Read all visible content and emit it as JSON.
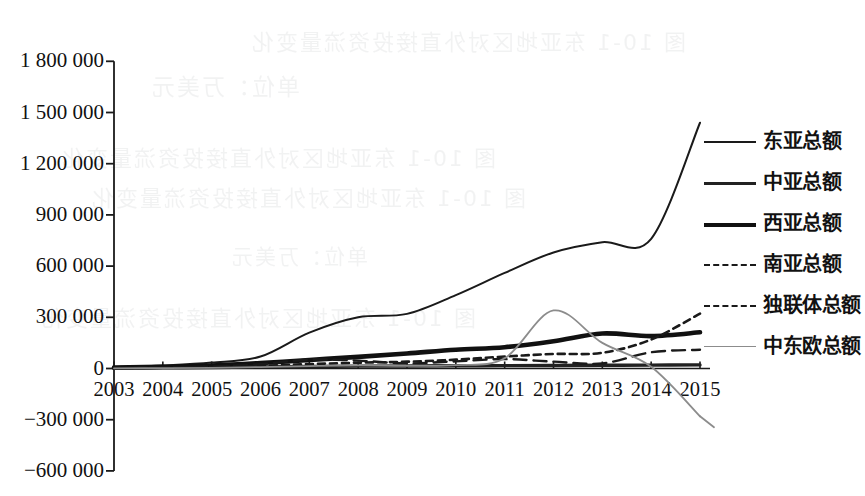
{
  "chart_data": {
    "type": "line",
    "title": "",
    "xlabel": "",
    "ylabel": "",
    "grid": false,
    "legend_position": "right",
    "x": [
      2003,
      2004,
      2005,
      2006,
      2007,
      2008,
      2009,
      2010,
      2011,
      2012,
      2013,
      2014,
      2015
    ],
    "xtick_labels": [
      "2003",
      "2004",
      "2005",
      "2006",
      "2007",
      "2008",
      "2009",
      "2010",
      "2011",
      "2012",
      "2013",
      "2014",
      "2015"
    ],
    "ytick_labels": [
      "1 800 000",
      "1 500 000",
      "1 200 000",
      "900 000",
      "600 000",
      "300 000",
      "0",
      "−300 000",
      "−600 000"
    ],
    "ytick_values": [
      1800000,
      1500000,
      1200000,
      900000,
      600000,
      300000,
      0,
      -300000,
      -600000
    ],
    "ylim": [
      -600000,
      1800000
    ],
    "xlim": [
      2003,
      2015
    ],
    "series": [
      {
        "name": "东亚总额",
        "style": "solid",
        "width": 2.0,
        "color": "#1a1a1a",
        "values": [
          8000,
          18000,
          35000,
          70000,
          210000,
          300000,
          320000,
          430000,
          560000,
          680000,
          740000,
          760000,
          1440000
        ]
      },
      {
        "name": "中亚总额",
        "style": "solid",
        "width": 3.4,
        "color": "#222222",
        "values": [
          2000,
          4000,
          6000,
          9000,
          12000,
          14000,
          15000,
          16000,
          17000,
          18000,
          19000,
          20000,
          21000
        ]
      },
      {
        "name": "西亚总额",
        "style": "solid",
        "width": 4.6,
        "color": "#111111",
        "values": [
          5000,
          10000,
          18000,
          32000,
          50000,
          68000,
          88000,
          110000,
          125000,
          160000,
          205000,
          190000,
          212000
        ]
      },
      {
        "name": "南亚总额",
        "style": "dashed-long",
        "width": 2.4,
        "color": "#1a1a1a",
        "values": [
          3000,
          6000,
          11000,
          25000,
          52000,
          46000,
          30000,
          42000,
          55000,
          40000,
          30000,
          95000,
          110000
        ]
      },
      {
        "name": "独联体总额",
        "style": "dashed-short",
        "width": 2.6,
        "color": "#1a1a1a",
        "values": [
          2000,
          5000,
          9000,
          16000,
          26000,
          34000,
          40000,
          52000,
          70000,
          85000,
          92000,
          170000,
          322000
        ]
      },
      {
        "name": "中东欧总额",
        "style": "solid",
        "width": 1.8,
        "color": "#8c8c8c",
        "values": [
          1000,
          2000,
          4000,
          8000,
          14000,
          18000,
          16000,
          20000,
          60000,
          340000,
          150000,
          10000,
          -280000
        ]
      }
    ]
  },
  "legend": {
    "items": [
      {
        "label": "东亚总额",
        "swatch": "line-thin-solid"
      },
      {
        "label": "中亚总额",
        "swatch": "line-medium-solid"
      },
      {
        "label": "西亚总额",
        "swatch": "line-thick-solid"
      },
      {
        "label": "南亚总额",
        "swatch": "line-dashed-long"
      },
      {
        "label": "独联体总额",
        "swatch": "line-dashed-short"
      },
      {
        "label": "中东欧总额",
        "swatch": "line-gray-solid"
      }
    ]
  },
  "scan_artifacts": {
    "note": "faint mirrored show-through text from reverse of scanned page",
    "lines": [
      "图 10-1  东亚地区对外直接投资流量变化",
      "单位：万美元"
    ]
  }
}
